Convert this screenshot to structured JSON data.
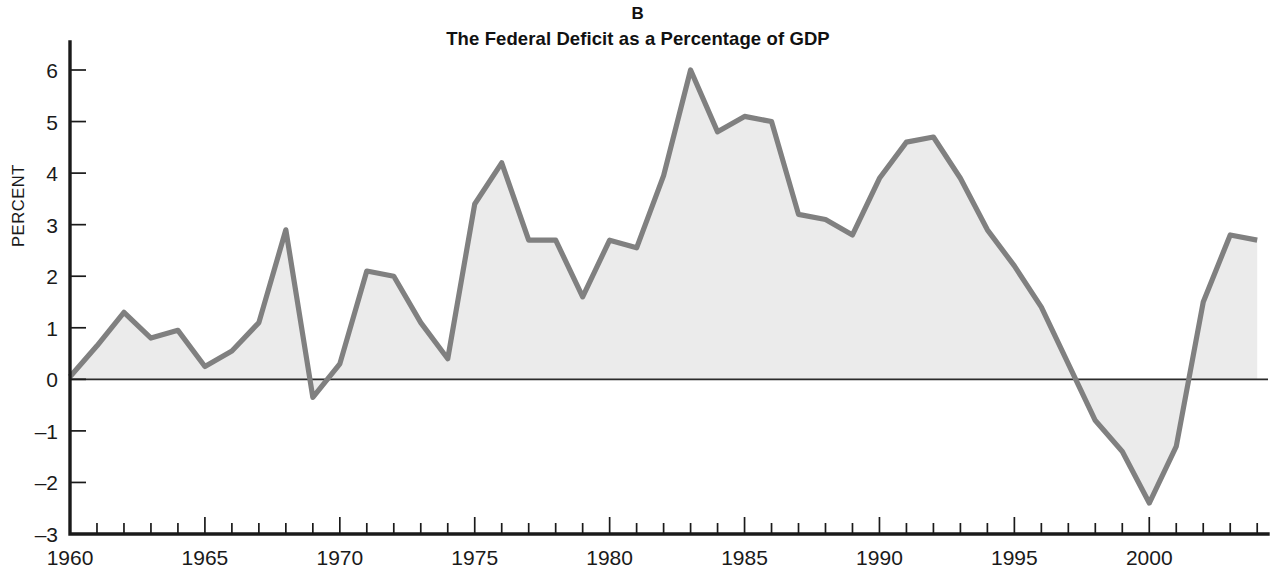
{
  "figure": {
    "panel_letter": "B",
    "title": "The Federal Deficit as a Percentage of GDP",
    "ylabel": "PERCENT"
  },
  "axes": {
    "y_tick_labels": [
      "6",
      "5",
      "4",
      "3",
      "2",
      "1",
      "0",
      "–1",
      "–2",
      "–3"
    ],
    "x_tick_labels": [
      "1960",
      "1965",
      "1970",
      "1975",
      "1980",
      "1985",
      "1990",
      "1995",
      "2000"
    ],
    "x_labeled_years": [
      1960,
      1965,
      1970,
      1975,
      1980,
      1985,
      1990,
      1995,
      2000
    ],
    "y_min": -3,
    "y_max": 6,
    "x_min": 1960,
    "x_max": 2004.4,
    "y_step": 1,
    "x_tick_step": 1
  },
  "colors": {
    "line": "#808080",
    "fill": "#ebebeb",
    "axis": "#1a1a1a",
    "text": "#111111",
    "background": "#ffffff"
  },
  "chart_data": {
    "type": "area",
    "title": "The Federal Deficit as a Percentage of GDP",
    "subtitle": "B",
    "xlabel": "",
    "ylabel": "PERCENT",
    "xlim": [
      1960,
      2004.4
    ],
    "ylim": [
      -3,
      6
    ],
    "grid": false,
    "legend": null,
    "baseline": 0,
    "x": [
      1960,
      1961,
      1962,
      1963,
      1964,
      1965,
      1966,
      1967,
      1968,
      1969,
      1970,
      1971,
      1972,
      1973,
      1974,
      1975,
      1976,
      1977,
      1978,
      1979,
      1980,
      1981,
      1982,
      1983,
      1984,
      1985,
      1986,
      1987,
      1988,
      1989,
      1990,
      1991,
      1992,
      1993,
      1994,
      1995,
      1996,
      1997,
      1998,
      1999,
      2000,
      2001,
      2002,
      2003,
      2004
    ],
    "values": [
      0.05,
      0.65,
      1.3,
      0.8,
      0.95,
      0.25,
      0.55,
      1.1,
      2.9,
      -0.35,
      0.3,
      2.1,
      2.0,
      1.1,
      0.4,
      3.4,
      4.2,
      2.7,
      2.7,
      1.6,
      2.7,
      2.55,
      3.95,
      6.0,
      4.8,
      5.1,
      5.0,
      3.2,
      3.1,
      2.8,
      3.9,
      4.6,
      4.7,
      3.9,
      2.9,
      2.2,
      1.4,
      0.3,
      -0.8,
      -1.4,
      -2.4,
      -1.3,
      1.5,
      2.8,
      2.7
    ],
    "series": [
      {
        "name": "Federal deficit as percentage of GDP",
        "values": [
          0.05,
          0.65,
          1.3,
          0.8,
          0.95,
          0.25,
          0.55,
          1.1,
          2.9,
          -0.35,
          0.3,
          2.1,
          2.0,
          1.1,
          0.4,
          3.4,
          4.2,
          2.7,
          2.7,
          1.6,
          2.7,
          2.55,
          3.95,
          6.0,
          4.8,
          5.1,
          5.0,
          3.2,
          3.1,
          2.8,
          3.9,
          4.6,
          4.7,
          3.9,
          2.9,
          2.2,
          1.4,
          0.3,
          -0.8,
          -1.4,
          -2.4,
          -1.3,
          1.5,
          2.8,
          2.7
        ]
      }
    ]
  }
}
